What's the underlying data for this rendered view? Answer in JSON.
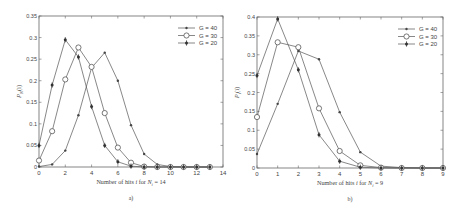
{
  "chart_data": [
    {
      "type": "line",
      "panel_label": "a)",
      "title": "",
      "xlabel": "Number of hits i for N_i = 14",
      "ylabel": "P_N(i)",
      "xlim": [
        0,
        14
      ],
      "ylim": [
        0,
        0.35
      ],
      "xticks": [
        0,
        2,
        4,
        6,
        8,
        10,
        12,
        14
      ],
      "yticks": [
        0,
        0.05,
        0.1,
        0.15,
        0.2,
        0.25,
        0.3,
        0.35
      ],
      "ytick_labels": [
        "0",
        "0.05",
        "0.1",
        "0.15",
        "0.2",
        "0.25",
        "0.3",
        "0.35"
      ],
      "legend_position": "upper right",
      "grid": false,
      "x": [
        0,
        1,
        2,
        3,
        4,
        5,
        6,
        7,
        8,
        9,
        10,
        11,
        12,
        13
      ],
      "series": [
        {
          "name": "G = 40",
          "marker": "dot",
          "values": [
            0.001,
            0.006,
            0.038,
            0.12,
            0.23,
            0.265,
            0.2,
            0.097,
            0.03,
            0.006,
            0.001,
            0,
            0,
            0
          ]
        },
        {
          "name": "G = 30",
          "marker": "circle",
          "values": [
            0.015,
            0.083,
            0.203,
            0.277,
            0.232,
            0.125,
            0.045,
            0.01,
            0.001,
            0,
            0,
            0,
            0,
            0
          ]
        },
        {
          "name": "G = 20",
          "marker": "star",
          "values": [
            0.05,
            0.19,
            0.295,
            0.255,
            0.14,
            0.05,
            0.012,
            0.002,
            0,
            0,
            0,
            0,
            0,
            0
          ]
        }
      ]
    },
    {
      "type": "line",
      "panel_label": "b)",
      "title": "",
      "xlabel": "Number of hits i for N_i = 9",
      "ylabel": "P_i(i)",
      "xlim": [
        0,
        9
      ],
      "ylim": [
        0,
        0.4
      ],
      "xticks": [
        0,
        1,
        2,
        3,
        4,
        5,
        6,
        7,
        8,
        9
      ],
      "yticks": [
        0,
        0.05,
        0.1,
        0.15,
        0.2,
        0.25,
        0.3,
        0.35,
        0.4
      ],
      "ytick_labels": [
        "0",
        "0.05",
        "0.1",
        "0.15",
        "0.2",
        "0.25",
        "0.3",
        "0.35",
        "0.4"
      ],
      "legend_position": "upper right",
      "grid": false,
      "x": [
        0,
        1,
        2,
        3,
        4,
        5,
        6,
        7,
        8,
        9
      ],
      "series": [
        {
          "name": "G = 40",
          "marker": "dot",
          "values": [
            0.037,
            0.17,
            0.31,
            0.288,
            0.148,
            0.042,
            0.005,
            0.001,
            0,
            0
          ]
        },
        {
          "name": "G = 30",
          "marker": "circle",
          "values": [
            0.135,
            0.333,
            0.32,
            0.158,
            0.045,
            0.007,
            0.001,
            0,
            0,
            0
          ]
        },
        {
          "name": "G = 20",
          "marker": "star",
          "values": [
            0.245,
            0.395,
            0.26,
            0.088,
            0.018,
            0.002,
            0,
            0,
            0,
            0
          ]
        }
      ]
    }
  ],
  "panels": {
    "a": {
      "caption": "a)",
      "xlabel_prefix": "Number of hits ",
      "xlabel_var": "i",
      "xlabel_mid": " for ",
      "xlabel_N": "N",
      "xlabel_sub": "i",
      "xlabel_suffix": " = 14",
      "ylabel_main": "P",
      "ylabel_sub": "N",
      "ylabel_arg": "(i)",
      "legend": [
        "G = 40",
        "G = 30",
        "G = 20"
      ]
    },
    "b": {
      "caption": "b)",
      "xlabel_prefix": "Number of hits ",
      "xlabel_var": "i",
      "xlabel_mid": " for ",
      "xlabel_N": "N",
      "xlabel_sub": "i",
      "xlabel_suffix": " = 9",
      "ylabel_main": "P",
      "ylabel_sub": "i",
      "ylabel_arg": "(i)",
      "legend": [
        "G = 40",
        "G = 30",
        "G = 20"
      ]
    }
  },
  "colors": {
    "line": "#555555",
    "axis": "#666666",
    "text": "#444444"
  }
}
